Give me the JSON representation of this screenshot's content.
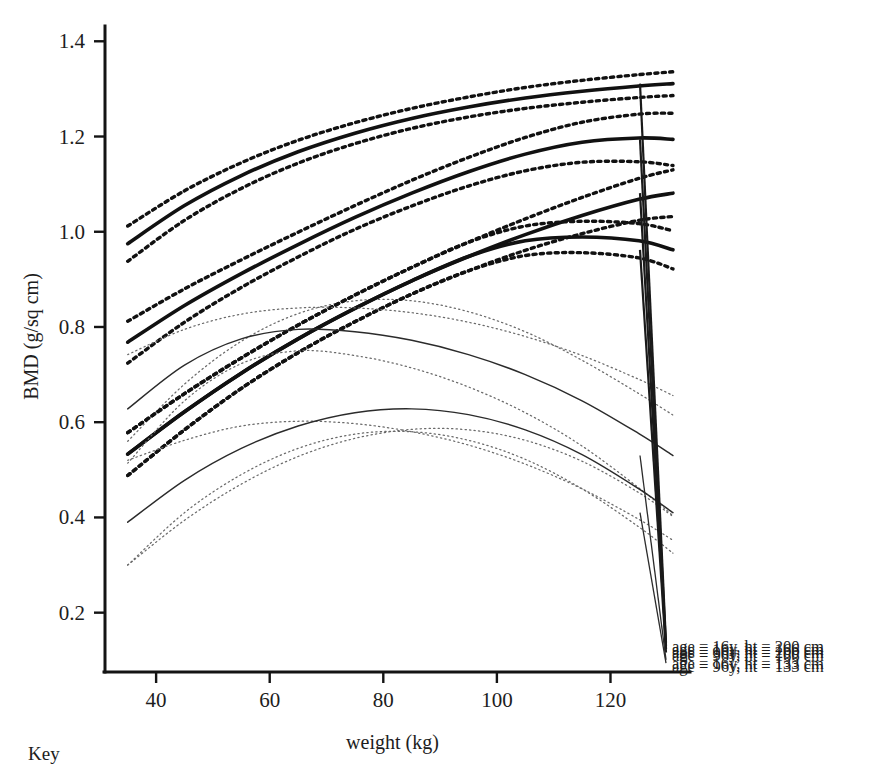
{
  "figure": {
    "key_label": "Key"
  },
  "chart_data": {
    "type": "line",
    "title": "",
    "xlabel": "weight (kg)",
    "ylabel": "BMD (g/sq cm)",
    "xlim": [
      31,
      134
    ],
    "ylim": [
      0.13,
      1.43
    ],
    "xticks": [
      40,
      60,
      80,
      100,
      120
    ],
    "xtick_labels": [
      "40",
      "60",
      "80",
      "100",
      "120"
    ],
    "yticks": [
      0.2,
      0.4,
      0.6,
      0.8,
      1.0,
      1.2,
      1.4
    ],
    "ytick_labels": [
      "0.2",
      "0.4",
      "0.6",
      "0.8",
      "1.0",
      "1.2",
      "1.4"
    ],
    "grid": false,
    "legend_position": "right-inline",
    "x": [
      35,
      45,
      55,
      65,
      75,
      85,
      95,
      105,
      115,
      125,
      131
    ],
    "series": [
      {
        "name": "age = 16y, ht = 200 cm",
        "label": "age = 16y, ht = 200 cm",
        "style": "thick-solid",
        "label_y": 0.1285,
        "values": [
          0.975,
          1.055,
          1.118,
          1.168,
          1.207,
          1.238,
          1.262,
          1.281,
          1.295,
          1.306,
          1.311
        ],
        "ci_upper": [
          1.012,
          1.086,
          1.145,
          1.192,
          1.229,
          1.259,
          1.283,
          1.303,
          1.318,
          1.33,
          1.336
        ],
        "ci_lower": [
          0.938,
          1.024,
          1.091,
          1.144,
          1.185,
          1.217,
          1.241,
          1.259,
          1.272,
          1.282,
          1.286
        ]
      },
      {
        "name": "age = 16y, ht = 166 cm",
        "label": "age = 16y, ht = 166 cm",
        "style": "thick-solid",
        "label_y": 0.1215,
        "values": [
          0.768,
          0.845,
          0.912,
          0.973,
          1.03,
          1.081,
          1.126,
          1.163,
          1.188,
          1.197,
          1.194
        ],
        "ci_upper": [
          0.812,
          0.88,
          0.941,
          0.999,
          1.055,
          1.108,
          1.156,
          1.198,
          1.23,
          1.247,
          1.249
        ],
        "ci_lower": [
          0.724,
          0.81,
          0.883,
          0.947,
          1.005,
          1.054,
          1.096,
          1.128,
          1.146,
          1.147,
          1.139
        ]
      },
      {
        "name": "age = 96y, ht = 200 cm",
        "label": "age = 96y, ht = 200 cm",
        "style": "thick-solid",
        "label_y": 0.115,
        "values": [
          0.533,
          0.622,
          0.703,
          0.775,
          0.839,
          0.897,
          0.948,
          0.994,
          1.034,
          1.068,
          1.081
        ],
        "ci_upper": [
          0.578,
          0.66,
          0.735,
          0.804,
          0.867,
          0.925,
          0.978,
          1.027,
          1.072,
          1.112,
          1.13
        ],
        "ci_lower": [
          0.488,
          0.584,
          0.671,
          0.746,
          0.811,
          0.869,
          0.918,
          0.961,
          0.996,
          1.024,
          1.032
        ]
      },
      {
        "name": "age = 96y, ht = 166 cm",
        "label": "age = 96y, ht = 166 cm",
        "style": "thick-solid",
        "label_y": 0.108,
        "values": [
          0.533,
          0.622,
          0.703,
          0.775,
          0.839,
          0.897,
          0.948,
          0.981,
          0.989,
          0.981,
          0.962
        ],
        "ci_upper": [
          0.578,
          0.66,
          0.735,
          0.804,
          0.867,
          0.925,
          0.978,
          1.012,
          1.022,
          1.017,
          1.002
        ],
        "ci_lower": [
          0.488,
          0.584,
          0.671,
          0.746,
          0.811,
          0.869,
          0.918,
          0.95,
          0.956,
          0.945,
          0.922
        ]
      },
      {
        "name": "age = 16y, ht = 133 cm",
        "label": "age = 16y, ht = 133 cm",
        "style": "thin-solid",
        "label_y": 0.0925,
        "values": [
          0.628,
          0.72,
          0.775,
          0.795,
          0.79,
          0.772,
          0.742,
          0.7,
          0.645,
          0.576,
          0.53
        ],
        "ci_upper": [
          0.742,
          0.795,
          0.827,
          0.84,
          0.84,
          0.83,
          0.81,
          0.78,
          0.74,
          0.69,
          0.656
        ],
        "ci_lower": [
          0.514,
          0.645,
          0.723,
          0.75,
          0.74,
          0.714,
          0.674,
          0.62,
          0.55,
          0.462,
          0.404
        ]
      },
      {
        "name": "age = 96y, ht = 133 cm",
        "label": "age = 96y, ht = 133 cm",
        "style": "thin-solid",
        "label_y": 0.0855,
        "values": [
          0.39,
          0.478,
          0.545,
          0.592,
          0.62,
          0.628,
          0.616,
          0.584,
          0.532,
          0.46,
          0.41
        ],
        "ci_upper": [
          0.52,
          0.562,
          0.592,
          0.602,
          0.597,
          0.58,
          0.552,
          0.512,
          0.46,
          0.396,
          0.352
        ],
        "ci_lower": [
          0.3,
          0.394,
          0.47,
          0.528,
          0.566,
          0.585,
          0.584,
          0.562,
          0.518,
          0.452,
          0.402
        ]
      }
    ],
    "extra_ci_curves": [
      {
        "name": "ci-thin-extra-upper-16-133",
        "values": [
          0.56,
          0.68,
          0.77,
          0.828,
          0.855,
          0.855,
          0.832,
          0.79,
          0.73,
          0.66,
          0.615
        ]
      },
      {
        "name": "ci-thin-extra-lower-96-133",
        "values": [
          0.3,
          0.41,
          0.49,
          0.545,
          0.575,
          0.58,
          0.562,
          0.522,
          0.46,
          0.38,
          0.325
        ]
      }
    ]
  }
}
